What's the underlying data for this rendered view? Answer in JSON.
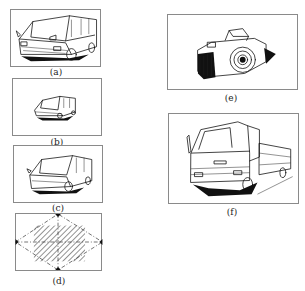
{
  "figure": {
    "panels": [
      {
        "id": "a",
        "caption": "(a)",
        "subject": "van-large-close"
      },
      {
        "id": "b",
        "caption": "(b)",
        "subject": "van-small-centered"
      },
      {
        "id": "c",
        "caption": "(c)",
        "subject": "van-medium"
      },
      {
        "id": "d",
        "caption": "(d)",
        "subject": "composition-diamond-guide"
      },
      {
        "id": "e",
        "caption": "(e)",
        "subject": "camera"
      },
      {
        "id": "f",
        "caption": "(f)",
        "subject": "truck"
      }
    ],
    "colors": {
      "line": "#111111",
      "frame": "#8a8a8a",
      "background": "#ffffff"
    }
  }
}
